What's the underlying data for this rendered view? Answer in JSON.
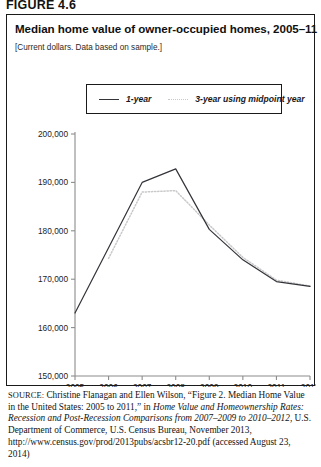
{
  "figure": {
    "label": "FIGURE 4.6"
  },
  "chart": {
    "title": "Median home value of owner-occupied homes, 2005–11",
    "subtitle": "[Current dollars. Data based on sample.]"
  },
  "legend": {
    "items": [
      {
        "label": "1-year",
        "style": "solid",
        "color": "#33343a"
      },
      {
        "label": "3-year using midpoint year",
        "style": "dotted",
        "color": "#c9c9c9"
      }
    ]
  },
  "source": {
    "kicker": "SOURCE:",
    "text_1": " Christine Flanagan and Ellen Wilson, “Figure 2. Median Home Value in the United States: 2005 to 2011,” in ",
    "text_italic": "Home Value and Homeownership Rates: Recession and Post-Recession Comparisons from 2007–2009 to 2010–2012,",
    "text_2": " U.S. Department of Commerce, U.S. Census Bureau, November 2013, http://www.census.gov/prod/2013pubs/acsbr12-20.pdf (accessed August 23, 2014)"
  },
  "chart_data": {
    "type": "line",
    "title": "Median home value of owner-occupied homes, 2005–11",
    "subtitle": "[Current dollars. Data based on sample.]",
    "xlabel": "",
    "ylabel": "",
    "x": [
      2005,
      2006,
      2007,
      2008,
      2009,
      2010,
      2011,
      2012
    ],
    "categories": [
      "2005",
      "2006",
      "2007",
      "2008",
      "2009",
      "2010",
      "2011",
      "2012"
    ],
    "xlim": [
      2005,
      2012
    ],
    "ylim": [
      150000,
      200000
    ],
    "yticks": [
      150000,
      160000,
      170000,
      180000,
      190000,
      200000
    ],
    "ytick_labels": [
      "150,000",
      "160,000",
      "170,000",
      "180,000",
      "190,000",
      "200,000"
    ],
    "grid": false,
    "legend_position": "top-center",
    "series": [
      {
        "name": "1-year",
        "style": "solid",
        "color": "#33343a",
        "x": [
          2005,
          2006,
          2007,
          2008,
          2009,
          2010,
          2011,
          2012
        ],
        "values": [
          163000,
          176500,
          190000,
          192800,
          180300,
          174000,
          169500,
          168500
        ]
      },
      {
        "name": "3-year using midpoint year",
        "style": "dotted",
        "color": "#c9c9c9",
        "x": [
          2006,
          2007,
          2008,
          2009,
          2010,
          2011,
          2012
        ],
        "values": [
          174300,
          188000,
          188300,
          181200,
          174500,
          169800,
          168600
        ]
      }
    ]
  }
}
